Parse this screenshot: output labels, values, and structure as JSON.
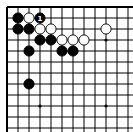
{
  "diagram": {
    "type": "go-board-corner",
    "origin_px": [
      7,
      7
    ],
    "spacing_px": 11,
    "visible_cols": 12,
    "visible_rows": 12,
    "edges": {
      "top": true,
      "left": true,
      "right": false,
      "bottom": false
    },
    "star_points": [
      [
        3,
        3
      ],
      [
        9,
        3
      ],
      [
        3,
        9
      ],
      [
        9,
        9
      ]
    ],
    "colors": {
      "line": "#000000",
      "black_stone": "#000000",
      "white_stone": "#ffffff",
      "background": "#ffffff"
    },
    "stones": [
      {
        "col": 1,
        "row": 1,
        "color": "black"
      },
      {
        "col": 2,
        "row": 1,
        "color": "white"
      },
      {
        "col": 3,
        "row": 1,
        "color": "black",
        "label": "1"
      },
      {
        "col": 1,
        "row": 2,
        "color": "black"
      },
      {
        "col": 2,
        "row": 2,
        "color": "black"
      },
      {
        "col": 3,
        "row": 2,
        "color": "white"
      },
      {
        "col": 4,
        "row": 2,
        "color": "white"
      },
      {
        "col": 9,
        "row": 2,
        "color": "white"
      },
      {
        "col": 3,
        "row": 3,
        "color": "black"
      },
      {
        "col": 4,
        "row": 3,
        "color": "black"
      },
      {
        "col": 5,
        "row": 3,
        "color": "white"
      },
      {
        "col": 6,
        "row": 3,
        "color": "white"
      },
      {
        "col": 7,
        "row": 3,
        "color": "white"
      },
      {
        "col": 2,
        "row": 4,
        "color": "black"
      },
      {
        "col": 5,
        "row": 4,
        "color": "black"
      },
      {
        "col": 6,
        "row": 4,
        "color": "black"
      },
      {
        "col": 2,
        "row": 7,
        "color": "black"
      }
    ]
  }
}
